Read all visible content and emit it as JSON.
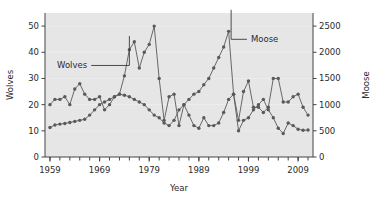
{
  "chart_data": {
    "type": "line",
    "title": "",
    "xlabel": "Year",
    "ylabel": "Wolves",
    "y2label": "Moose",
    "xlim": [
      1958,
      2012
    ],
    "ylim": [
      0,
      55
    ],
    "y2lim": [
      0,
      2750
    ],
    "grid": false,
    "legend": "annotations",
    "xticks": [
      1959,
      1969,
      1979,
      1989,
      1999,
      2009
    ],
    "xticklabels": [
      "1959",
      "1969",
      "1979",
      "1989",
      "1999",
      "2009"
    ],
    "xminortick_step": 2,
    "yticks": [
      0,
      10,
      20,
      30,
      40,
      50
    ],
    "yticklabels": [
      "0",
      "10",
      "20",
      "30",
      "40",
      "50"
    ],
    "y2ticks": [
      0,
      500,
      1000,
      1500,
      2000,
      2500
    ],
    "y2ticklabels": [
      "0",
      "500",
      "1000",
      "1500",
      "2000",
      "2500"
    ],
    "annotations": [
      {
        "text": "Wolves",
        "x": 1966.5,
        "y": 34,
        "leader_to_x": 1975.0,
        "leader_to_y": 34
      },
      {
        "text": "Moose",
        "x": 1999.5,
        "y": 44,
        "leader_to_x": 1995.5,
        "leader_to_y": 44
      }
    ],
    "series": [
      {
        "name": "Wolves",
        "axis": "left",
        "color": "#595959",
        "marker": "circle",
        "x": [
          1959,
          1960,
          1961,
          1962,
          1963,
          1964,
          1965,
          1966,
          1967,
          1968,
          1969,
          1970,
          1971,
          1972,
          1973,
          1974,
          1975,
          1976,
          1977,
          1978,
          1979,
          1980,
          1981,
          1982,
          1983,
          1984,
          1985,
          1986,
          1987,
          1988,
          1989,
          1990,
          1991,
          1992,
          1993,
          1994,
          1995,
          1996,
          1997,
          1998,
          1999,
          2000,
          2001,
          2002,
          2003,
          2004,
          2005,
          2006,
          2007,
          2008,
          2009,
          2010,
          2011
        ],
        "values": [
          20,
          22,
          22,
          23,
          20,
          26,
          28,
          24,
          22,
          22,
          23,
          18,
          20,
          23,
          24,
          31,
          41,
          44,
          34,
          40,
          43,
          50,
          30,
          14,
          23,
          24,
          12,
          20,
          16,
          12,
          11,
          15,
          12,
          12,
          13,
          17,
          22,
          24,
          14,
          25,
          29,
          19,
          19,
          17,
          19,
          30,
          30,
          21,
          21,
          23,
          24,
          19,
          16
        ]
      },
      {
        "name": "Moose",
        "axis": "right",
        "color": "#595959",
        "marker": "circle",
        "x": [
          1959,
          1960,
          1961,
          1962,
          1963,
          1964,
          1965,
          1966,
          1967,
          1968,
          1969,
          1970,
          1971,
          1972,
          1973,
          1974,
          1975,
          1976,
          1977,
          1978,
          1979,
          1980,
          1981,
          1982,
          1983,
          1984,
          1985,
          1986,
          1987,
          1988,
          1989,
          1990,
          1991,
          1992,
          1993,
          1994,
          1995,
          1996,
          1997,
          1998,
          1999,
          2000,
          2001,
          2002,
          2003,
          2004,
          2005,
          2006,
          2007,
          2008,
          2009,
          2010,
          2011
        ],
        "values": [
          563,
          610,
          628,
          640,
          660,
          680,
          700,
          720,
          800,
          900,
          1000,
          1050,
          1100,
          1150,
          1200,
          1180,
          1150,
          1100,
          1050,
          1000,
          900,
          800,
          750,
          650,
          600,
          700,
          900,
          1000,
          1100,
          1200,
          1250,
          1380,
          1500,
          1700,
          1900,
          2100,
          2400,
          1200,
          500,
          700,
          750,
          900,
          1000,
          1100,
          900,
          750,
          550,
          450,
          650,
          600,
          530,
          510,
          515
        ]
      }
    ]
  }
}
